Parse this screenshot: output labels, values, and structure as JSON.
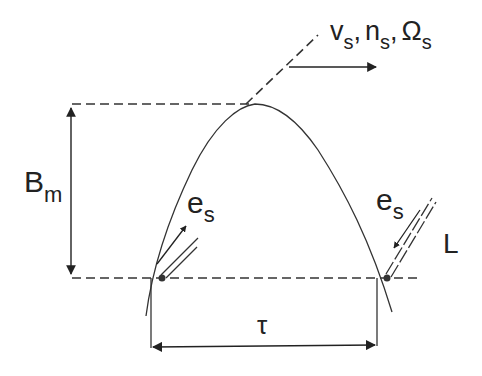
{
  "diagram": {
    "labels": {
      "amplitude_main": "B",
      "amplitude_sub": "m",
      "velocity_v": "v",
      "velocity_n": "n",
      "velocity_omega": "Ω",
      "speed_sub": "s",
      "separator": ",",
      "emf_left_main": "e",
      "emf_left_sub": "s",
      "emf_right_main": "e",
      "emf_right_sub": "s",
      "conductor": "L",
      "pole_pitch": "τ"
    },
    "colors": {
      "stroke": "#333333",
      "background": "#ffffff"
    }
  }
}
